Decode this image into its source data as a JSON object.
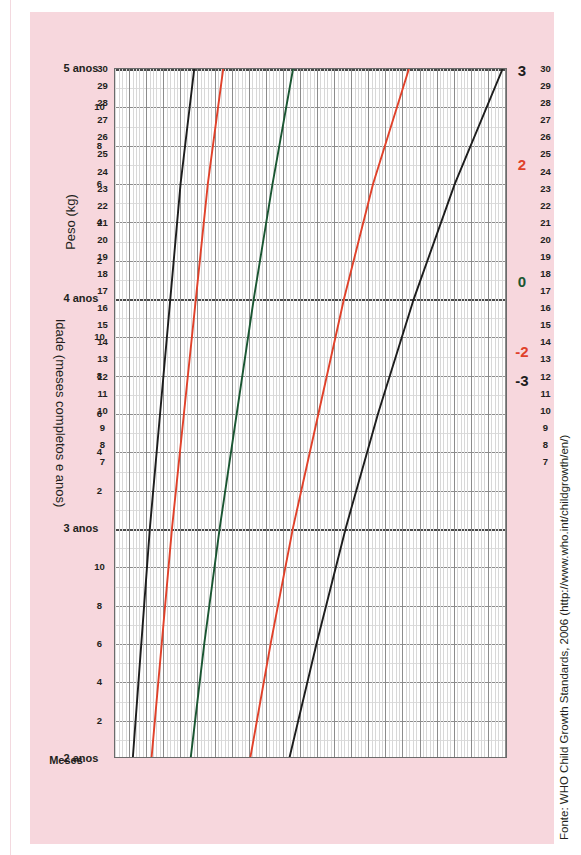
{
  "chart_data": {
    "type": "line",
    "title": "",
    "xlabel": "Idade (meses completos e anos)",
    "ylabel": "Peso (kg)",
    "xlim": [
      24,
      60
    ],
    "ylim": [
      7,
      30
    ],
    "grid": true,
    "legend_position": "top-inline",
    "x_unit": "months",
    "x_major_labels": [
      "2 anos",
      "3 anos",
      "4 anos",
      "5 anos"
    ],
    "x_major_values": [
      24,
      36,
      48,
      60
    ],
    "x_minor_labels": [
      "2",
      "4",
      "6",
      "8",
      "10"
    ],
    "y_tick_labels": [
      "30",
      "29",
      "28",
      "27",
      "26",
      "25",
      "24",
      "23",
      "22",
      "21",
      "20",
      "19",
      "18",
      "17",
      "16",
      "15",
      "14",
      "13",
      "12",
      "11",
      "10",
      "9",
      "8",
      "7"
    ],
    "y_tick_values": [
      30,
      29,
      28,
      27,
      26,
      25,
      24,
      23,
      22,
      21,
      20,
      19,
      18,
      17,
      16,
      15,
      14,
      13,
      12,
      11,
      10,
      9,
      8,
      7
    ],
    "series": [
      {
        "name": "3",
        "label": "3",
        "color": "#1d1d1d",
        "x": [
          24,
          30,
          36,
          42,
          48,
          54,
          60
        ],
        "values": [
          17.3,
          18.9,
          20.6,
          22.5,
          24.6,
          27.0,
          29.8
        ]
      },
      {
        "name": "2",
        "label": "2",
        "color": "#e0412a",
        "x": [
          24,
          30,
          36,
          42,
          48,
          54,
          60
        ],
        "values": [
          15.0,
          16.2,
          17.5,
          19.0,
          20.5,
          22.2,
          24.3
        ]
      },
      {
        "name": "0",
        "label": "0",
        "color": "#1a5632",
        "x": [
          24,
          30,
          36,
          42,
          48,
          54,
          60
        ],
        "values": [
          11.5,
          12.3,
          13.2,
          14.2,
          15.2,
          16.3,
          17.5
        ]
      },
      {
        "name": "-2",
        "label": "-2",
        "color": "#e0412a",
        "x": [
          24,
          30,
          36,
          42,
          48,
          54,
          60
        ],
        "values": [
          9.2,
          9.8,
          10.4,
          11.1,
          11.8,
          12.5,
          13.4
        ]
      },
      {
        "name": "-3",
        "label": "-3",
        "color": "#1d1d1d",
        "x": [
          24,
          30,
          36,
          42,
          48,
          54,
          60
        ],
        "values": [
          8.1,
          8.6,
          9.1,
          9.7,
          10.3,
          10.9,
          11.7
        ]
      }
    ]
  },
  "axes": {
    "x_title": "Idade (meses completos e anos)",
    "y_title": "Peso (kg)",
    "months_label": "Meses"
  },
  "source": {
    "text": "Fonte: WHO Child Growth Standards, 2006 (http://www.who.int/childgrowth/en/)"
  },
  "colors": {
    "background": "#f7d7dd",
    "plot_background": "#ffffff",
    "z3": "#1d1d1d",
    "z2": "#e0412a",
    "z0": "#1a5632",
    "grid_minor": "#dcdcdc",
    "grid_major": "#8c8c8c",
    "axis": "#6b6b6b",
    "text": "#231f20"
  }
}
